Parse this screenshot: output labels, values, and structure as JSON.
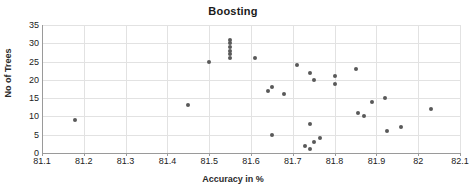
{
  "chart_data": {
    "type": "scatter",
    "title": "Boosting",
    "xlabel": "Accuracy in %",
    "ylabel": "No of Trees",
    "xlim": [
      81.1,
      82.1
    ],
    "ylim": [
      0,
      35
    ],
    "xticks": [
      81.1,
      81.2,
      81.3,
      81.4,
      81.5,
      81.6,
      81.7,
      81.8,
      81.9,
      82.0,
      82.1
    ],
    "xtick_labels": [
      "81.1",
      "81.2",
      "81.3",
      "81.4",
      "81.5",
      "81.6",
      "81.7",
      "81.8",
      "81.9",
      "82",
      "82.1"
    ],
    "yticks": [
      0,
      5,
      10,
      15,
      20,
      25,
      30,
      35
    ],
    "ytick_labels": [
      "0",
      "5",
      "10",
      "15",
      "20",
      "25",
      "30",
      "35"
    ],
    "grid": true,
    "legend": false,
    "marker_color": "#595959",
    "gridline_color": "#e2e2e2",
    "axis_color": "#9a9a9a",
    "points": [
      {
        "x": 81.18,
        "y": 9
      },
      {
        "x": 81.45,
        "y": 13
      },
      {
        "x": 81.5,
        "y": 25
      },
      {
        "x": 81.55,
        "y": 26
      },
      {
        "x": 81.55,
        "y": 27
      },
      {
        "x": 81.55,
        "y": 28
      },
      {
        "x": 81.55,
        "y": 29
      },
      {
        "x": 81.55,
        "y": 30
      },
      {
        "x": 81.55,
        "y": 31
      },
      {
        "x": 81.61,
        "y": 26
      },
      {
        "x": 81.64,
        "y": 17
      },
      {
        "x": 81.65,
        "y": 18
      },
      {
        "x": 81.65,
        "y": 5
      },
      {
        "x": 81.68,
        "y": 16
      },
      {
        "x": 81.71,
        "y": 24
      },
      {
        "x": 81.73,
        "y": 2
      },
      {
        "x": 81.74,
        "y": 22
      },
      {
        "x": 81.74,
        "y": 8
      },
      {
        "x": 81.74,
        "y": 1
      },
      {
        "x": 81.75,
        "y": 20
      },
      {
        "x": 81.75,
        "y": 3
      },
      {
        "x": 81.765,
        "y": 4
      },
      {
        "x": 81.8,
        "y": 21
      },
      {
        "x": 81.8,
        "y": 19
      },
      {
        "x": 81.85,
        "y": 23
      },
      {
        "x": 81.855,
        "y": 11
      },
      {
        "x": 81.87,
        "y": 10
      },
      {
        "x": 81.89,
        "y": 14
      },
      {
        "x": 81.92,
        "y": 15
      },
      {
        "x": 81.925,
        "y": 6
      },
      {
        "x": 81.96,
        "y": 7
      },
      {
        "x": 82.03,
        "y": 12
      }
    ]
  }
}
